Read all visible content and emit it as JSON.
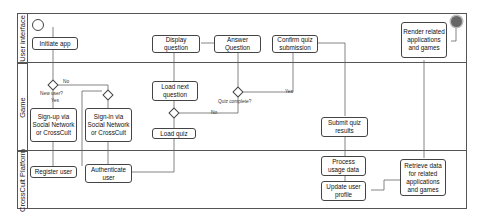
{
  "lanes": [
    {
      "label": "User interface"
    },
    {
      "label": "Game"
    },
    {
      "label": "CrossCult Platform"
    }
  ],
  "nodes": {
    "initiate_app": "Initiate app",
    "signup": "Sign-up via Social Network or CrossCult",
    "signin": "Sign-in via Social Network or CrossCult",
    "register_user": "Register user",
    "authenticate_user": "Authenticate user",
    "load_quiz": "Load quiz",
    "load_next_question": "Load next question",
    "display_question": "Display question",
    "answer_question": "Answer Question",
    "confirm_quiz_submission": "Confirm quiz submission",
    "submit_quiz_results": "Submit quiz results",
    "process_usage_data": "Process usage data",
    "update_user_profile": "Update user profile",
    "retrieve_data": "Retrieve data for related applications and games",
    "render_related": "Render related applications and games"
  },
  "decisions": {
    "new_user": "New user?",
    "new_user_yes": "Yes",
    "new_user_no": "No",
    "quiz_complete": "Quiz complete?",
    "quiz_complete_yes": "Yes",
    "quiz_complete_no": "No"
  },
  "colors": {
    "line": "#444444",
    "end_node": "#666666"
  }
}
